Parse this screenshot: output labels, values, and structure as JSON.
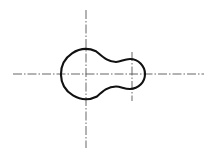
{
  "drawing": {
    "type": "technical-drawing",
    "description": "Keyhole / peanut-shaped outline with dash-dot center lines",
    "colors": {
      "outline": "#111111",
      "centerline": "#555555",
      "background": "#ffffff"
    },
    "large_circle": {
      "cx": 86,
      "cy": 74,
      "r": 25
    },
    "small_circle": {
      "cx": 132,
      "cy": 74,
      "r": 15
    },
    "centerlines": {
      "horizontal": {
        "x1": 13,
        "y1": 74,
        "x2": 204,
        "y2": 74
      },
      "vertical_main": {
        "x1": 86,
        "y1": 10,
        "x2": 86,
        "y2": 148
      },
      "vertical_secondary": {
        "x1": 132,
        "y1": 52,
        "x2": 132,
        "y2": 101
      }
    }
  }
}
